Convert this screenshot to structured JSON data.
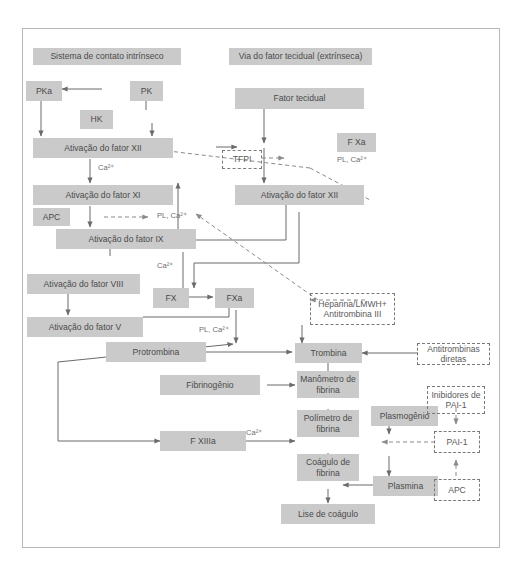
{
  "diagram": {
    "colors": {
      "box_fill": "#cacaca",
      "box_text": "#4a4a4a",
      "dashed_border": "#7a7a7a",
      "arrow_solid": "#6b6b6b",
      "arrow_dashed": "#8a8a8a",
      "frame_border": "#b8b8b8",
      "background": "#ffffff"
    },
    "headers": [
      {
        "id": "hdr-intrinsic",
        "label": "Sistema de contato intrínseco"
      },
      {
        "id": "hdr-extrinsic",
        "label": "Via do fator tecidual (extrínseca)"
      }
    ],
    "boxes": [
      {
        "id": "pka",
        "label": "PKa"
      },
      {
        "id": "pk",
        "label": "PK"
      },
      {
        "id": "hk",
        "label": "HK"
      },
      {
        "id": "ativacao-xii-int",
        "label": "Ativação do fator XII"
      },
      {
        "id": "ativacao-xi",
        "label": "Ativação do fator XI"
      },
      {
        "id": "apc-left",
        "label": "APC"
      },
      {
        "id": "ativacao-ix",
        "label": "Ativação do fator IX"
      },
      {
        "id": "ativacao-viii",
        "label": "Ativação do fator VIII"
      },
      {
        "id": "ativacao-v",
        "label": "Ativação do fator V"
      },
      {
        "id": "fx",
        "label": "FX"
      },
      {
        "id": "fxa",
        "label": "FXa"
      },
      {
        "id": "protrombina",
        "label": "Protrombina"
      },
      {
        "id": "fibrinogenio",
        "label": "Fibrinogênio"
      },
      {
        "id": "f-xiiia",
        "label": "F XIIIa"
      },
      {
        "id": "fator-tecidual",
        "label": "Fator tecidual"
      },
      {
        "id": "f-xa",
        "label": "F Xa"
      },
      {
        "id": "ativacao-xii-ext",
        "label": "Ativação do fator XII"
      },
      {
        "id": "trombina",
        "label": "Trombina"
      },
      {
        "id": "manometro-fibrina",
        "label": "Manômetro de fibrina"
      },
      {
        "id": "polimetro-fibrina",
        "label": "Polímetro de fibrina"
      },
      {
        "id": "coagulo-fibrina",
        "label": "Coágulo de fibrina"
      },
      {
        "id": "lise-coagulo",
        "label": "Lise de coágulo"
      },
      {
        "id": "plasmogenio",
        "label": "Plasmogênio"
      },
      {
        "id": "plasmina",
        "label": "Plasmina"
      }
    ],
    "dashed_boxes": [
      {
        "id": "tfpi",
        "label": "TFPI"
      },
      {
        "id": "heparina",
        "label": "Heparina/LMWH+ Antitrombina III"
      },
      {
        "id": "antitrombinas-diretas",
        "label": "Antitrombinas diretas"
      },
      {
        "id": "inibidores-pai1",
        "label": "Inibidores de PAI-1"
      },
      {
        "id": "pai1",
        "label": "PAI-1"
      },
      {
        "id": "apc-right",
        "label": "APC"
      }
    ],
    "cofactor_notes": [
      {
        "id": "note-ca-1",
        "label": "Ca²⁺"
      },
      {
        "id": "note-plca-1",
        "label": "PL, Ca²⁺"
      },
      {
        "id": "note-ca-2",
        "label": "Ca²⁺"
      },
      {
        "id": "note-plca-2",
        "label": "PL, Ca²⁺"
      },
      {
        "id": "note-plca-3",
        "label": "PL, Ca²⁺"
      },
      {
        "id": "note-ca-3",
        "label": "Ca²⁺"
      }
    ]
  }
}
